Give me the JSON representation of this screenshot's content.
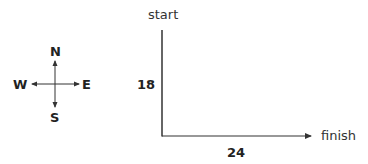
{
  "compass": {
    "north": "N",
    "south": "S",
    "east": "E",
    "west": "W"
  },
  "diagram": {
    "start_label": "start",
    "finish_label": "finish",
    "vertical_length": "18",
    "horizontal_length": "24"
  }
}
